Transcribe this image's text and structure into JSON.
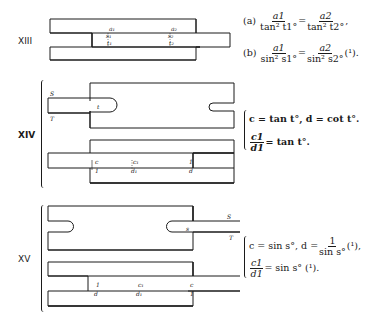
{
  "figures": [
    {
      "label": "XIII",
      "scale_marks": [
        "a1",
        "s1",
        "t1",
        "a2",
        "s2",
        "t2"
      ],
      "equations": {
        "a": {
          "prefix": "(a)",
          "lhs_num": "a1",
          "lhs_den": "tan² t1°",
          "rhs_num": "a2",
          "rhs_den": "tan² t2°",
          "suffix": ","
        },
        "b": {
          "prefix": "(b)",
          "lhs_num": "a1",
          "lhs_den": "sin² s1°",
          "rhs_num": "a2",
          "rhs_den": "sin² s2°",
          "suffix": "(¹)."
        }
      }
    },
    {
      "label": "XIV",
      "scale_marks": [
        "S",
        "T",
        "t",
        "c",
        "1",
        "c1",
        "d1",
        "1",
        "d"
      ],
      "equations": {
        "line1": "c = tan t°,  d = cot t°.",
        "line2_num": "c1",
        "line2_den": "d1",
        "line2_rhs": "= tan t°."
      }
    },
    {
      "label": "XV",
      "scale_marks": [
        "S",
        "T",
        "s",
        "1",
        "d",
        "c1",
        "d1",
        "c",
        "1"
      ],
      "equations": {
        "line1_prefix": "c = sin s°,  d =",
        "line1_num": "1",
        "line1_den": "sin s°",
        "line1_suffix": "(¹),",
        "line2_num": "c1",
        "line2_den": "d1",
        "line2_rhs": "= sin s° (¹)."
      }
    }
  ]
}
